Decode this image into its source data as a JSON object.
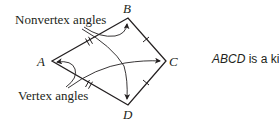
{
  "figure": {
    "shape": "kite",
    "vertices": [
      {
        "label": "A",
        "x": 52,
        "y": 61
      },
      {
        "label": "B",
        "x": 128,
        "y": 18
      },
      {
        "label": "C",
        "x": 166,
        "y": 61
      },
      {
        "label": "D",
        "x": 128,
        "y": 105
      }
    ],
    "congruent_sides": [
      {
        "sides": [
          "AB",
          "AD"
        ],
        "tick_marks": 2
      },
      {
        "sides": [
          "BC",
          "CD"
        ],
        "tick_marks": 1
      }
    ],
    "annotations": {
      "nonvertex_label": "Nonvertex angles",
      "vertex_label": "Vertex angles"
    },
    "stroke_color": "#231f20"
  },
  "caption": {
    "name": "ABCD",
    "text": " is a kite."
  }
}
